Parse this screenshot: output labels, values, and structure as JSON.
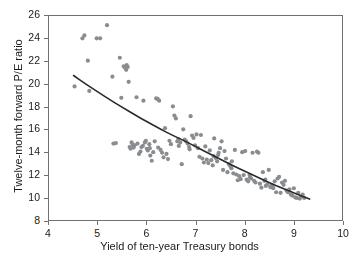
{
  "chart_data": {
    "type": "scatter",
    "title": "",
    "subtitle": "",
    "xlabel": "Yield of ten-year Treasury bonds",
    "ylabel": "Twelve-month forward P/E ratio",
    "xlim": [
      4,
      10
    ],
    "ylim": [
      8,
      26
    ],
    "xticks": [
      4,
      5,
      6,
      7,
      8,
      9,
      10
    ],
    "yticks": [
      8,
      10,
      12,
      14,
      16,
      18,
      20,
      22,
      24,
      26
    ],
    "xtick_labels": [
      "4",
      "5",
      "6",
      "7",
      "8",
      "9",
      "10"
    ],
    "ytick_labels": [
      "8",
      "10",
      "12",
      "14",
      "16",
      "18",
      "20",
      "22",
      "24",
      "26"
    ],
    "grid": false,
    "legend": null,
    "annotations": [],
    "point_color": "#8a8d90",
    "point_size": 2.1,
    "curve_color": "#2b2b2b",
    "curve_width": 1.6,
    "axis_color": "#6f7275",
    "series": [
      {
        "name": "Yield vs forward P/E",
        "marker": "circle",
        "points": [
          [
            4.52,
            19.85
          ],
          [
            4.68,
            24.05
          ],
          [
            4.72,
            24.3
          ],
          [
            4.79,
            22.1
          ],
          [
            4.82,
            19.45
          ],
          [
            4.97,
            24.05
          ],
          [
            5.04,
            24.05
          ],
          [
            5.18,
            25.2
          ],
          [
            5.29,
            20.7
          ],
          [
            5.31,
            14.85
          ],
          [
            5.36,
            14.9
          ],
          [
            5.44,
            22.35
          ],
          [
            5.47,
            18.85
          ],
          [
            5.52,
            21.6
          ],
          [
            5.55,
            21.45
          ],
          [
            5.58,
            21.7
          ],
          [
            5.6,
            21.55
          ],
          [
            5.62,
            20.25
          ],
          [
            5.64,
            14.55
          ],
          [
            5.66,
            14.4
          ],
          [
            5.68,
            14.95
          ],
          [
            5.7,
            14.75
          ],
          [
            5.72,
            14.5
          ],
          [
            5.74,
            14.7
          ],
          [
            5.78,
            18.9
          ],
          [
            5.8,
            14.85
          ],
          [
            5.83,
            13.95
          ],
          [
            5.86,
            14.15
          ],
          [
            5.88,
            14.55
          ],
          [
            5.92,
            18.6
          ],
          [
            5.95,
            14.95
          ],
          [
            5.97,
            15.1
          ],
          [
            5.99,
            14.4
          ],
          [
            6.01,
            14.25
          ],
          [
            6.04,
            14.8
          ],
          [
            6.06,
            13.8
          ],
          [
            6.09,
            13.35
          ],
          [
            6.12,
            14.1
          ],
          [
            6.15,
            15.05
          ],
          [
            6.18,
            18.8
          ],
          [
            6.21,
            18.75
          ],
          [
            6.24,
            18.6
          ],
          [
            6.27,
            14.3
          ],
          [
            6.3,
            14.05
          ],
          [
            6.33,
            13.65
          ],
          [
            6.36,
            16.2
          ],
          [
            6.39,
            13.95
          ],
          [
            6.42,
            13.5
          ],
          [
            6.45,
            15.1
          ],
          [
            6.48,
            14.8
          ],
          [
            6.52,
            18.1
          ],
          [
            6.55,
            17.3
          ],
          [
            6.58,
            17.05
          ],
          [
            6.61,
            15.05
          ],
          [
            6.64,
            14.65
          ],
          [
            6.67,
            14.95
          ],
          [
            6.7,
            13.05
          ],
          [
            6.73,
            16.1
          ],
          [
            6.76,
            15.2
          ],
          [
            6.79,
            15.05
          ],
          [
            6.82,
            14.85
          ],
          [
            6.85,
            14.55
          ],
          [
            6.88,
            17.25
          ],
          [
            6.91,
            15.55
          ],
          [
            6.94,
            15.35
          ],
          [
            6.97,
            14.7
          ],
          [
            7.0,
            15.65
          ],
          [
            7.03,
            14.45
          ],
          [
            7.06,
            13.7
          ],
          [
            7.09,
            15.6
          ],
          [
            7.12,
            13.55
          ],
          [
            7.15,
            13.2
          ],
          [
            7.18,
            14.6
          ],
          [
            7.21,
            13.45
          ],
          [
            7.24,
            13.15
          ],
          [
            7.27,
            14.25
          ],
          [
            7.3,
            13.4
          ],
          [
            7.33,
            12.95
          ],
          [
            7.36,
            15.3
          ],
          [
            7.39,
            13.6
          ],
          [
            7.42,
            13.3
          ],
          [
            7.45,
            14.05
          ],
          [
            7.48,
            14.45
          ],
          [
            7.51,
            15.05
          ],
          [
            7.54,
            12.55
          ],
          [
            7.57,
            14.2
          ],
          [
            7.6,
            13.55
          ],
          [
            7.63,
            12.35
          ],
          [
            7.66,
            13.05
          ],
          [
            7.69,
            12.85
          ],
          [
            7.72,
            13.3
          ],
          [
            7.75,
            12.25
          ],
          [
            7.78,
            14.3
          ],
          [
            7.81,
            12.15
          ],
          [
            7.84,
            11.65
          ],
          [
            7.87,
            12.0
          ],
          [
            7.9,
            11.75
          ],
          [
            7.93,
            14.1
          ],
          [
            7.96,
            12.1
          ],
          [
            7.99,
            14.2
          ],
          [
            8.02,
            11.7
          ],
          [
            8.05,
            11.55
          ],
          [
            8.08,
            12.1
          ],
          [
            8.11,
            11.8
          ],
          [
            8.14,
            14.05
          ],
          [
            8.17,
            11.6
          ],
          [
            8.2,
            11.45
          ],
          [
            8.23,
            14.15
          ],
          [
            8.26,
            14.05
          ],
          [
            8.29,
            11.35
          ],
          [
            8.32,
            11.0
          ],
          [
            8.35,
            12.35
          ],
          [
            8.38,
            11.6
          ],
          [
            8.41,
            11.15
          ],
          [
            8.44,
            11.3
          ],
          [
            8.47,
            12.55
          ],
          [
            8.5,
            11.05
          ],
          [
            8.53,
            11.2
          ],
          [
            8.56,
            10.95
          ],
          [
            8.59,
            11.55
          ],
          [
            8.62,
            10.6
          ],
          [
            8.65,
            11.8
          ],
          [
            8.68,
            11.95
          ],
          [
            8.71,
            10.55
          ],
          [
            8.74,
            11.45
          ],
          [
            8.77,
            11.25
          ],
          [
            8.8,
            11.6
          ],
          [
            8.83,
            10.75
          ],
          [
            8.86,
            10.6
          ],
          [
            8.89,
            10.85
          ],
          [
            8.92,
            10.4
          ],
          [
            8.95,
            10.3
          ],
          [
            8.98,
            10.95
          ],
          [
            9.01,
            10.15
          ],
          [
            9.04,
            10.1
          ],
          [
            9.07,
            10.55
          ],
          [
            9.1,
            10.05
          ],
          [
            9.13,
            10.25
          ],
          [
            9.16,
            10.4
          ],
          [
            9.19,
            10.1
          ],
          [
            5.57,
            21.3
          ],
          [
            6.22,
            14.5
          ],
          [
            6.05,
            14.45
          ],
          [
            7.44,
            13.85
          ],
          [
            8.09,
            11.9
          ],
          [
            6.63,
            15.25
          ],
          [
            7.71,
            12.7
          ],
          [
            5.91,
            14.65
          ],
          [
            8.55,
            11.1
          ],
          [
            6.86,
            14.35
          ],
          [
            7.35,
            13.75
          ],
          [
            8.4,
            11.7
          ]
        ]
      }
    ],
    "fit_curve": {
      "name": "fitted trend",
      "points": [
        [
          4.5,
          20.8
        ],
        [
          4.75,
          20.05
        ],
        [
          5.0,
          19.35
        ],
        [
          5.25,
          18.65
        ],
        [
          5.5,
          18.0
        ],
        [
          5.75,
          17.35
        ],
        [
          6.0,
          16.75
        ],
        [
          6.25,
          16.15
        ],
        [
          6.5,
          15.6
        ],
        [
          6.75,
          15.1
        ],
        [
          7.0,
          14.55
        ],
        [
          7.25,
          14.0
        ],
        [
          7.5,
          13.45
        ],
        [
          7.75,
          12.9
        ],
        [
          8.0,
          12.4
        ],
        [
          8.25,
          11.9
        ],
        [
          8.5,
          11.4
        ],
        [
          8.75,
          10.95
        ],
        [
          9.0,
          10.5
        ],
        [
          9.3,
          10.0
        ]
      ]
    }
  }
}
